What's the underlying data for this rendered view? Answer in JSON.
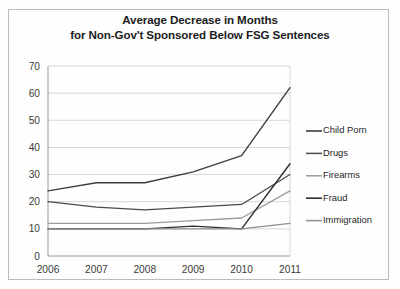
{
  "chart_data": {
    "type": "line",
    "title": "Average Decrease in Months for Non-Gov't Sponsored Below FSG Sentences",
    "title_lines": [
      "Average Decrease in Months",
      "for Non-Gov't Sponsored Below FSG Sentences"
    ],
    "xlabel": "",
    "ylabel": "",
    "categories": [
      "2006",
      "2007",
      "2008",
      "2009",
      "2010",
      "2011"
    ],
    "x": [
      2006,
      2007,
      2008,
      2009,
      2010,
      2011
    ],
    "ylim": [
      0,
      70
    ],
    "ytick_labels": [
      "0",
      "10",
      "20",
      "30",
      "40",
      "50",
      "60",
      "70"
    ],
    "yticks": [
      0,
      10,
      20,
      30,
      40,
      50,
      60,
      70
    ],
    "grid": true,
    "legend_position": "right",
    "series": [
      {
        "name": "Child Porn",
        "values": [
          24,
          27,
          27,
          31,
          37,
          62
        ],
        "color": "#3d3d3d",
        "width": 1.4
      },
      {
        "name": "Drugs",
        "values": [
          20,
          18,
          17,
          18,
          19,
          30
        ],
        "color": "#4a4a4a",
        "width": 1.3
      },
      {
        "name": "Firearms",
        "values": [
          12,
          12,
          12,
          13,
          14,
          24
        ],
        "color": "#9b9b9b",
        "width": 1.3
      },
      {
        "name": "Fraud",
        "values": [
          10,
          10,
          10,
          11,
          10,
          34
        ],
        "color": "#2e2e2e",
        "width": 1.4
      },
      {
        "name": "Immigration",
        "values": [
          10,
          10,
          10,
          10,
          10,
          12
        ],
        "color": "#8e8e8e",
        "width": 1.3
      }
    ]
  }
}
